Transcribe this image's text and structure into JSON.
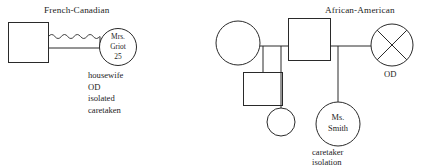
{
  "figure": {
    "type": "genogram-diagram",
    "background": "#ffffff",
    "stroke_color": "#2a2a2a",
    "width": 431,
    "height": 167
  },
  "left_genogram": {
    "ethnicity_label": "French-Canadian",
    "male": {
      "shape": "square",
      "label": ""
    },
    "female": {
      "shape": "circle",
      "line1": "Mrs.",
      "line2": "Griot",
      "line3": "25"
    },
    "relationship_line": "wavy-conflictual-plus-marriage",
    "notes": [
      "housewife",
      "OD",
      "isolated",
      "caretaken"
    ]
  },
  "right_genogram": {
    "ethnicity_label": "African-American",
    "grandmother": {
      "shape": "circle",
      "label": ""
    },
    "father": {
      "shape": "square",
      "label": ""
    },
    "mother_deceased": {
      "shape": "circle-with-x",
      "label": "",
      "status_label": "OD"
    },
    "son": {
      "shape": "square",
      "label": ""
    },
    "daughter": {
      "shape": "circle",
      "label": ""
    },
    "index_person": {
      "shape": "circle",
      "line1": "Ms.",
      "line2": "Smith"
    },
    "notes": [
      "caretaker",
      "isolation"
    ]
  }
}
